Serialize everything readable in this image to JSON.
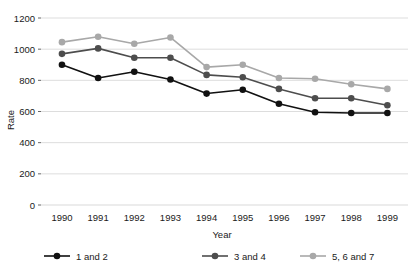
{
  "chart_data": {
    "type": "line",
    "title": "",
    "xlabel": "Year",
    "ylabel": "Rate",
    "categories": [
      "1990",
      "1991",
      "1992",
      "1993",
      "1994",
      "1995",
      "1996",
      "1997",
      "1998",
      "1999"
    ],
    "ylim": [
      0,
      1200
    ],
    "yticks": [
      0,
      200,
      400,
      600,
      800,
      1000,
      1200
    ],
    "ytick_labels": [
      "0",
      "200",
      "400",
      "600",
      "800",
      "1000",
      "1200"
    ],
    "grid": true,
    "legend_position": "bottom",
    "series": [
      {
        "name": "1 and 2",
        "color": "#111111",
        "values": [
          900,
          815,
          855,
          805,
          715,
          740,
          650,
          595,
          590,
          590
        ]
      },
      {
        "name": "3 and 4",
        "color": "#4d4d4d",
        "values": [
          970,
          1005,
          945,
          945,
          835,
          820,
          745,
          685,
          685,
          640
        ]
      },
      {
        "name": "5, 6 and 7",
        "color": "#a8a8a8",
        "values": [
          1045,
          1080,
          1035,
          1075,
          885,
          900,
          815,
          810,
          775,
          745
        ]
      }
    ]
  },
  "axes": {
    "y_title": "Rate",
    "x_title": "Year"
  },
  "legend": {
    "items": [
      {
        "label": "1 and 2",
        "color": "#111111",
        "marker": "circle-marker"
      },
      {
        "label": "3 and 4",
        "color": "#4d4d4d",
        "marker": "circle-marker"
      },
      {
        "label": "5, 6 and 7",
        "color": "#a8a8a8",
        "marker": "circle-marker"
      }
    ]
  },
  "colors": {
    "background": "#ffffff",
    "grid": "#d9d9d9",
    "axis": "#555555",
    "text": "#1a1a1a"
  }
}
